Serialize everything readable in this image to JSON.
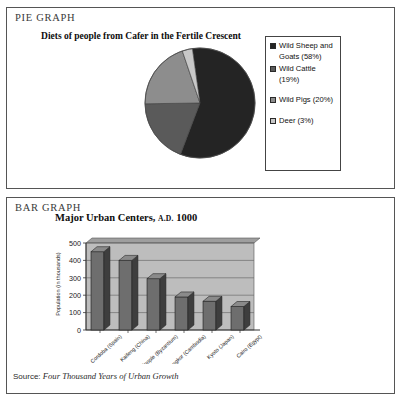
{
  "pie_section": {
    "panel_label": "PIE GRAPH",
    "title": "Diets of people from Cafer in the Fertile Crescent"
  },
  "bar_section": {
    "panel_label": "BAR GRAPH",
    "title_main": "Major Urban Centers,",
    "title_era": "A.D.",
    "title_year": "1000",
    "source_prefix": "Source:",
    "source_title": "Four Thousand Years of Urban Growth"
  },
  "chart_data": [
    {
      "type": "pie",
      "title": "Diets of people from Cafer in the Fertile Crescent",
      "labels": [
        "Wild Sheep and Goats (58%)",
        "Wild Cattle (19%)",
        "Wild Pigs (20%)",
        "Deer (3%)"
      ],
      "legend_labels": [
        "Wild Sheep and Goats (58%)",
        "Wild Cattle (19%)",
        "Wild Pigs (20%)",
        "Deer (3%)"
      ],
      "values": [
        58,
        19,
        20,
        3
      ],
      "colors": [
        "#242424",
        "#5a5a5a",
        "#8d8d8d",
        "#c8c8c8"
      ],
      "legend_position": "right",
      "start_angle_deg": -8
    },
    {
      "type": "bar",
      "title": "Major Urban Centers, A.D. 1000",
      "xlabel": "",
      "ylabel": "Population (in thousands)",
      "categories": [
        "Cordoba (Spain)",
        "Kaifeng (China)",
        "Constantinople (Byzantium)",
        "Angkor (Cambodia)",
        "Kyoto (Japan)",
        "Cairo (Egypt)"
      ],
      "values": [
        450,
        400,
        295,
        190,
        165,
        135
      ],
      "ylim": [
        0,
        500
      ],
      "yticks": [
        0,
        100,
        200,
        300,
        400,
        500
      ],
      "ytick_labels": [
        "0",
        "100",
        "200",
        "300",
        "400",
        "500"
      ],
      "grid": true,
      "plot_bg": "#bdbdbd",
      "bar_color": "#6e6e6e",
      "bar_side_color": "#3e3e3e"
    }
  ]
}
